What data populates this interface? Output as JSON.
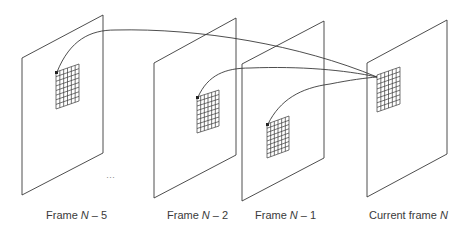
{
  "diagram": {
    "title": "",
    "frames": [
      {
        "id": "frame-n-5",
        "label_prefix": "Frame ",
        "label_var": "N",
        "label_suffix": " – 5"
      },
      {
        "id": "frame-n-2",
        "label_prefix": "Frame ",
        "label_var": "N",
        "label_suffix": " – 2"
      },
      {
        "id": "frame-n-1",
        "label_prefix": "Frame ",
        "label_var": "N",
        "label_suffix": " – 1"
      },
      {
        "id": "current-frame",
        "label_prefix": "Current frame ",
        "label_var": "N",
        "label_suffix": ""
      }
    ],
    "ellipsis": "···",
    "grid": {
      "columns": 6,
      "rows": 8
    },
    "connections": [
      {
        "from": "frame-n-5",
        "to": "current-frame"
      },
      {
        "from": "frame-n-2",
        "to": "current-frame"
      },
      {
        "from": "frame-n-1",
        "to": "current-frame"
      }
    ],
    "colors": {
      "stroke": "#3a3a3a",
      "ellipsis": "#8a8a8a",
      "background": "#ffffff"
    }
  }
}
